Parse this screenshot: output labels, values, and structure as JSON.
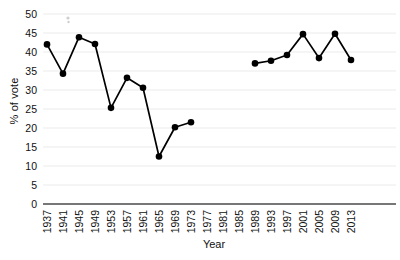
{
  "chart_data": {
    "type": "line",
    "title": "",
    "subtitle": "",
    "xlabel": "Year",
    "ylabel": "% of vote",
    "grid": true,
    "legend": false,
    "legend_position": "none",
    "marker": "filled-circle",
    "color": "#000000",
    "xlim": [
      1935,
      2015
    ],
    "ylim": [
      0,
      50
    ],
    "ytick_step": 5,
    "xtick_step": 4,
    "yticks": [
      0,
      5,
      10,
      15,
      20,
      25,
      30,
      35,
      40,
      45,
      50
    ],
    "ytick_labels": [
      "0",
      "5",
      "10",
      "15",
      "20",
      "25",
      "30",
      "35",
      "40",
      "45",
      "50"
    ],
    "xticks": [
      1937,
      1941,
      1945,
      1949,
      1953,
      1957,
      1961,
      1965,
      1969,
      1973,
      1977,
      1981,
      1985,
      1989,
      1993,
      1997,
      2001,
      2005,
      2009,
      2013
    ],
    "xtick_labels": [
      "1937",
      "1941",
      "1945",
      "1949",
      "1953",
      "1957",
      "1961",
      "1965",
      "1969",
      "1973",
      "1977",
      "1981",
      "1985",
      "1989",
      "1993",
      "1997",
      "2001",
      "2005",
      "2009",
      "2013"
    ],
    "xtick_rotation": 90,
    "gap_years": [
      1977,
      1981,
      1985
    ],
    "series": [
      {
        "name": "segment-1",
        "x": [
          1937,
          1941,
          1945,
          1949,
          1953,
          1957,
          1961,
          1965,
          1969,
          1973
        ],
        "values": [
          42.0,
          34.3,
          43.9,
          42.1,
          25.3,
          33.2,
          30.6,
          12.5,
          20.2,
          21.5
        ]
      },
      {
        "name": "segment-2",
        "x": [
          1989,
          1993,
          1997,
          2001,
          2005,
          2009,
          2013
        ],
        "values": [
          37.0,
          37.7,
          39.2,
          44.7,
          38.4,
          44.8,
          37.9
        ]
      }
    ]
  }
}
